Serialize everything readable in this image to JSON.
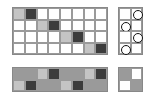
{
  "colors": {
    "white": "#ffffff",
    "light": "#c4c4c4",
    "medium": "#9a9a9a",
    "dark": "#3c3c3c"
  },
  "top_grid": {
    "rows": 4,
    "cols": 8,
    "cells": [
      [
        "light",
        "dark",
        "white",
        "white",
        "white",
        "white",
        "white",
        "white"
      ],
      [
        "white",
        "white",
        "light",
        "dark",
        "white",
        "white",
        "white",
        "white"
      ],
      [
        "white",
        "white",
        "white",
        "white",
        "light",
        "dark",
        "white",
        "white"
      ],
      [
        "white",
        "white",
        "white",
        "white",
        "white",
        "white",
        "light",
        "dark"
      ]
    ]
  },
  "right_grid": {
    "rows": 4,
    "cols": 2,
    "circles": [
      [
        0,
        1
      ],
      [
        1,
        0
      ],
      [
        2,
        1
      ],
      [
        3,
        0
      ]
    ]
  },
  "bottom_grid": {
    "rows": 2,
    "cols": 8,
    "cells": [
      [
        "medium",
        "medium",
        "light",
        "dark",
        "medium",
        "medium",
        "light",
        "dark"
      ],
      [
        "light",
        "dark",
        "medium",
        "medium",
        "light",
        "dark",
        "medium",
        "medium"
      ]
    ]
  },
  "bottom_right_grid": {
    "rows": 2,
    "cols": 2,
    "cells": [
      [
        "medium",
        "white"
      ],
      [
        "white",
        "medium"
      ]
    ]
  }
}
